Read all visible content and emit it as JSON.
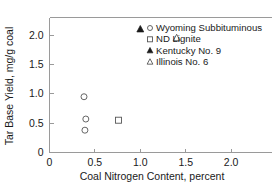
{
  "chart_data": {
    "type": "scatter",
    "title": "",
    "xlabel": "Coal Nitrogen Content, percent",
    "ylabel": "Tar Base Yield, mg/g coal",
    "xlim": [
      0,
      2.45
    ],
    "ylim": [
      0,
      2.3
    ],
    "xticks": [
      "0",
      "0.5",
      "1.0",
      "1.5",
      "2.0"
    ],
    "xtick_values": [
      0,
      0.5,
      1.0,
      1.5,
      2.0
    ],
    "yticks": [
      "0",
      "0.5",
      "1.0",
      "1.5",
      "2.0"
    ],
    "ytick_values": [
      0,
      0.5,
      1.0,
      1.5,
      2.0
    ],
    "grid": false,
    "legend_position": "upper right",
    "series": [
      {
        "name": "Wyoming Subbituminous",
        "marker": "open-circle",
        "points": [
          {
            "x": 0.38,
            "y": 0.95
          },
          {
            "x": 0.4,
            "y": 0.57
          },
          {
            "x": 0.39,
            "y": 0.38
          }
        ]
      },
      {
        "name": "ND Lignite",
        "marker": "open-square",
        "points": [
          {
            "x": 0.76,
            "y": 0.55
          }
        ]
      },
      {
        "name": "Kentucky No. 9",
        "marker": "filled-triangle",
        "points": [
          {
            "x": 1.0,
            "y": 2.1
          }
        ]
      },
      {
        "name": "Illinois No. 6",
        "marker": "open-triangle",
        "points": [
          {
            "x": 1.4,
            "y": 1.95
          }
        ]
      }
    ]
  },
  "legend": {
    "entries": [
      {
        "label": "Wyoming Subbituminous",
        "marker": "open-circle"
      },
      {
        "label": "ND Lignite",
        "marker": "open-square"
      },
      {
        "label": "Kentucky No. 9",
        "marker": "filled-triangle"
      },
      {
        "label": "Illinois No. 6",
        "marker": "open-triangle"
      }
    ]
  },
  "colors": {
    "axis": "#9a9a9a",
    "text": "#1a1a1a",
    "marker_open": "#555555",
    "marker_filled": "#1a1a1a",
    "background": "#ffffff"
  }
}
